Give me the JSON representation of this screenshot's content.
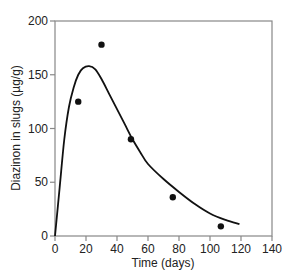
{
  "chart_data": {
    "type": "scatter",
    "title": "",
    "xlabel": "Time (days)",
    "ylabel": "Diazinon in slugs (µg/g)",
    "xlim": [
      0,
      140
    ],
    "ylim": [
      0,
      200
    ],
    "xticks": [
      0,
      20,
      40,
      60,
      80,
      100,
      120,
      140
    ],
    "yticks": [
      0,
      50,
      100,
      150,
      200
    ],
    "grid": false,
    "legend": null,
    "frame": "box",
    "series": [
      {
        "name": "Observed",
        "kind": "scatter",
        "x": [
          15,
          30,
          49,
          76,
          107
        ],
        "y": [
          125,
          178,
          90,
          36,
          9
        ]
      },
      {
        "name": "Fitted curve",
        "kind": "line",
        "x": [
          0,
          3,
          6,
          9,
          12,
          15,
          18,
          22,
          26,
          30,
          35,
          40,
          45,
          50,
          55,
          60,
          70,
          80,
          90,
          100,
          110,
          119
        ],
        "y": [
          0,
          45,
          90,
          120,
          138,
          150,
          156,
          158,
          155,
          146,
          132,
          118,
          104,
          90,
          78,
          67,
          53,
          41,
          30,
          21,
          15,
          11
        ]
      }
    ]
  }
}
